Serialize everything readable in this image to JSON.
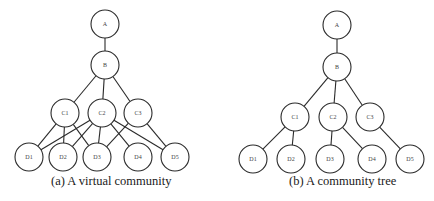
{
  "diagrams": [
    {
      "id": "a",
      "caption": "(a) A virtual community",
      "caption_pos": {
        "x": 51,
        "y": 174
      },
      "node_radius": 14,
      "nodes": [
        {
          "id": "A",
          "label": "A",
          "x": 105,
          "y": 24
        },
        {
          "id": "B",
          "label": "B",
          "x": 105,
          "y": 65
        },
        {
          "id": "C1",
          "label": "C1",
          "x": 65,
          "y": 113
        },
        {
          "id": "C2",
          "label": "C2",
          "x": 102,
          "y": 113
        },
        {
          "id": "C3",
          "label": "C3",
          "x": 138,
          "y": 113
        },
        {
          "id": "D1",
          "label": "D1",
          "x": 29,
          "y": 157
        },
        {
          "id": "D2",
          "label": "D2",
          "x": 63,
          "y": 157
        },
        {
          "id": "D3",
          "label": "D3",
          "x": 97,
          "y": 157
        },
        {
          "id": "D4",
          "label": "D4",
          "x": 138,
          "y": 157
        },
        {
          "id": "D5",
          "label": "D5",
          "x": 175,
          "y": 157
        }
      ],
      "edges": [
        [
          "A",
          "B"
        ],
        [
          "B",
          "C1"
        ],
        [
          "B",
          "C2"
        ],
        [
          "B",
          "C3"
        ],
        [
          "C1",
          "D1"
        ],
        [
          "C1",
          "D2"
        ],
        [
          "C1",
          "D3"
        ],
        [
          "C2",
          "D1"
        ],
        [
          "C2",
          "D2"
        ],
        [
          "C2",
          "D3"
        ],
        [
          "C2",
          "D4"
        ],
        [
          "C2",
          "D5"
        ],
        [
          "C3",
          "D3"
        ],
        [
          "C3",
          "D5"
        ]
      ]
    },
    {
      "id": "b",
      "caption": "(b) A community tree",
      "caption_pos": {
        "x": 289,
        "y": 174
      },
      "node_radius": 14,
      "nodes": [
        {
          "id": "A",
          "label": "A",
          "x": 337,
          "y": 25
        },
        {
          "id": "B",
          "label": "B",
          "x": 337,
          "y": 67
        },
        {
          "id": "C1",
          "label": "C1",
          "x": 295,
          "y": 117
        },
        {
          "id": "C2",
          "label": "C2",
          "x": 333,
          "y": 117
        },
        {
          "id": "C3",
          "label": "C3",
          "x": 370,
          "y": 117
        },
        {
          "id": "D1",
          "label": "D1",
          "x": 253,
          "y": 159
        },
        {
          "id": "D2",
          "label": "D2",
          "x": 291,
          "y": 159
        },
        {
          "id": "D3",
          "label": "D3",
          "x": 330,
          "y": 159
        },
        {
          "id": "D4",
          "label": "D4",
          "x": 372,
          "y": 159
        },
        {
          "id": "D5",
          "label": "D5",
          "x": 410,
          "y": 159
        }
      ],
      "edges": [
        [
          "A",
          "B"
        ],
        [
          "B",
          "C1"
        ],
        [
          "B",
          "C2"
        ],
        [
          "B",
          "C3"
        ],
        [
          "C1",
          "D1"
        ],
        [
          "C1",
          "D2"
        ],
        [
          "C2",
          "D3"
        ],
        [
          "C2",
          "D4"
        ],
        [
          "C3",
          "D5"
        ]
      ]
    }
  ],
  "colors": {
    "background": "#ffffff",
    "stroke": "#2a2a2a",
    "node_label": "#444444",
    "caption": "#1a1a1a"
  }
}
